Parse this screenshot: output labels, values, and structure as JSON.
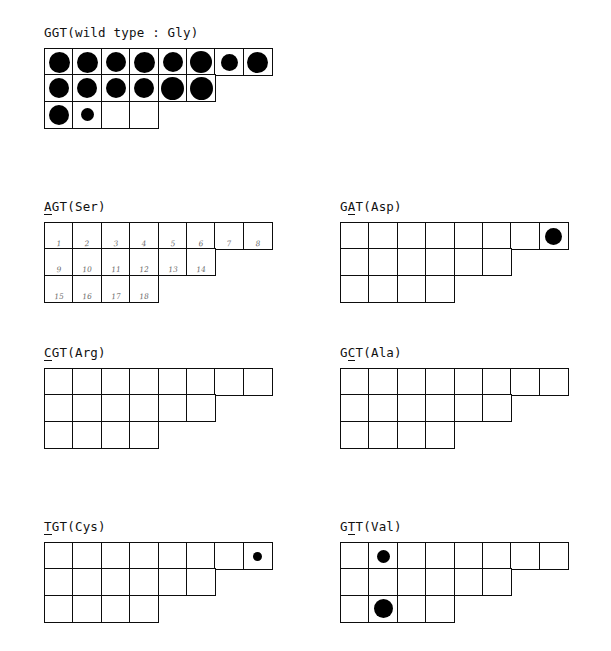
{
  "figure": {
    "caption_type": "dot-blot-hybridization-grid-panels",
    "background_color": "#ffffff",
    "ink_color": "#000000",
    "grid": {
      "cell_width": 30,
      "cell_height": 28,
      "row_lengths": [
        8,
        6,
        4
      ]
    }
  },
  "panels": [
    {
      "id": "ggt-wild-type",
      "title_prefix": "GGT(wild type : Gly)",
      "title_mutant_base": "",
      "title_suffix": "",
      "codon": "GGT",
      "amino_acid": "Gly",
      "note": "wild type",
      "left": 44,
      "top": 25,
      "show_numbers": false,
      "dots": [
        {
          "row": 0,
          "col": 0,
          "size": 21
        },
        {
          "row": 0,
          "col": 1,
          "size": 21
        },
        {
          "row": 0,
          "col": 2,
          "size": 20
        },
        {
          "row": 0,
          "col": 3,
          "size": 21
        },
        {
          "row": 0,
          "col": 4,
          "size": 20
        },
        {
          "row": 0,
          "col": 5,
          "size": 22
        },
        {
          "row": 0,
          "col": 6,
          "size": 17
        },
        {
          "row": 0,
          "col": 7,
          "size": 21
        },
        {
          "row": 1,
          "col": 0,
          "size": 20
        },
        {
          "row": 1,
          "col": 1,
          "size": 20
        },
        {
          "row": 1,
          "col": 2,
          "size": 20
        },
        {
          "row": 1,
          "col": 3,
          "size": 20
        },
        {
          "row": 1,
          "col": 4,
          "size": 23
        },
        {
          "row": 1,
          "col": 5,
          "size": 23
        },
        {
          "row": 2,
          "col": 0,
          "size": 20
        },
        {
          "row": 2,
          "col": 1,
          "size": 13
        }
      ]
    },
    {
      "id": "agt-ser",
      "title_prefix": "",
      "title_mutant_base": "A",
      "title_suffix": "GT(Ser)",
      "codon": "AGT",
      "amino_acid": "Ser",
      "note": "",
      "left": 44,
      "top": 199,
      "show_numbers": true,
      "dots": []
    },
    {
      "id": "gat-asp",
      "title_prefix": "G",
      "title_mutant_base": "A",
      "title_suffix": "T(Asp)",
      "codon": "GAT",
      "amino_acid": "Asp",
      "note": "",
      "left": 340,
      "top": 199,
      "show_numbers": false,
      "dots": [
        {
          "row": 0,
          "col": 7,
          "size": 17
        }
      ]
    },
    {
      "id": "cgt-arg",
      "title_prefix": "",
      "title_mutant_base": "C",
      "title_suffix": "GT(Arg)",
      "codon": "CGT",
      "amino_acid": "Arg",
      "note": "",
      "left": 44,
      "top": 345,
      "show_numbers": false,
      "dots": []
    },
    {
      "id": "gct-ala",
      "title_prefix": "G",
      "title_mutant_base": "C",
      "title_suffix": "T(Ala)",
      "codon": "GCT",
      "amino_acid": "Ala",
      "note": "",
      "left": 340,
      "top": 345,
      "show_numbers": false,
      "dots": []
    },
    {
      "id": "tgt-cys",
      "title_prefix": "",
      "title_mutant_base": "T",
      "title_suffix": "GT(Cys)",
      "codon": "TGT",
      "amino_acid": "Cys",
      "note": "",
      "left": 44,
      "top": 519,
      "show_numbers": false,
      "dots": [
        {
          "row": 0,
          "col": 7,
          "size": 9
        }
      ]
    },
    {
      "id": "gtt-val",
      "title_prefix": "G",
      "title_mutant_base": "T",
      "title_suffix": "T(Val)",
      "codon": "GTT",
      "amino_acid": "Val",
      "note": "",
      "left": 340,
      "top": 519,
      "show_numbers": false,
      "dots": [
        {
          "row": 0,
          "col": 1,
          "size": 13
        },
        {
          "row": 2,
          "col": 1,
          "size": 19
        }
      ]
    }
  ],
  "cell_numbers": [
    [
      "1",
      "2",
      "3",
      "4",
      "5",
      "6",
      "7",
      "8"
    ],
    [
      "9",
      "10",
      "11",
      "12",
      "13",
      "14"
    ],
    [
      "15",
      "16",
      "17",
      "18"
    ]
  ]
}
